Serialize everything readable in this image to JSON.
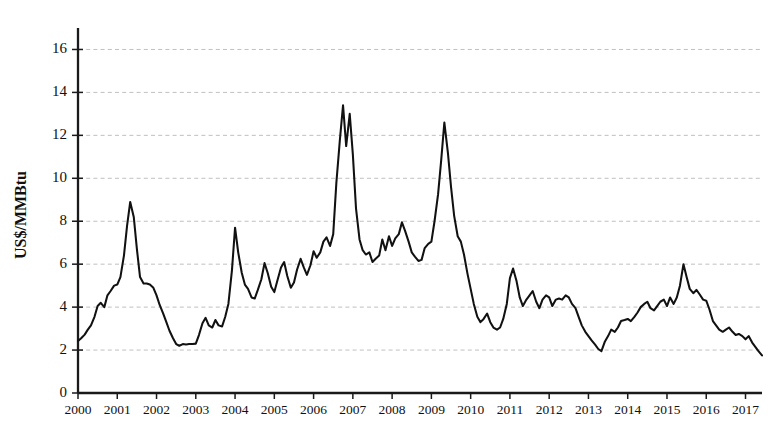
{
  "chart_data": {
    "type": "line",
    "title": "",
    "subtitle": "",
    "xlabel": "",
    "ylabel": "US$/MMBtu",
    "ylim": [
      0,
      17
    ],
    "xlim": [
      2000,
      2017.42
    ],
    "grid": true,
    "grid_axis": "y",
    "legend": false,
    "legend_position": "none",
    "annotations": [],
    "ytick_labels": [
      "0",
      "2",
      "4",
      "6",
      "8",
      "10",
      "12",
      "14",
      "16"
    ],
    "ytick_values": [
      0,
      2,
      4,
      6,
      8,
      10,
      12,
      14,
      16
    ],
    "xtick_labels": [
      "2000",
      "2001",
      "2002",
      "2003",
      "2004",
      "2005",
      "2006",
      "2007",
      "2008",
      "2009",
      "2010",
      "2011",
      "2012",
      "2013",
      "2014",
      "2015",
      "2016",
      "2017"
    ],
    "xtick_values": [
      2000,
      2001,
      2002,
      2003,
      2004,
      2005,
      2006,
      2007,
      2008,
      2009,
      2010,
      2011,
      2012,
      2013,
      2014,
      2015,
      2016,
      2017
    ],
    "series": [
      {
        "name": "Natural gas price",
        "color": "#111111",
        "x": [
          2000.0,
          2000.08,
          2000.17,
          2000.25,
          2000.33,
          2000.42,
          2000.5,
          2000.58,
          2000.67,
          2000.75,
          2000.83,
          2000.92,
          2001.0,
          2001.08,
          2001.17,
          2001.25,
          2001.33,
          2001.42,
          2001.5,
          2001.58,
          2001.67,
          2001.75,
          2001.83,
          2001.92,
          2002.0,
          2002.08,
          2002.17,
          2002.25,
          2002.33,
          2002.42,
          2002.5,
          2002.58,
          2002.67,
          2002.75,
          2002.83,
          2002.92,
          2003.0,
          2003.08,
          2003.17,
          2003.25,
          2003.33,
          2003.42,
          2003.5,
          2003.58,
          2003.67,
          2003.75,
          2003.83,
          2003.92,
          2004.0,
          2004.08,
          2004.17,
          2004.25,
          2004.33,
          2004.42,
          2004.5,
          2004.58,
          2004.67,
          2004.75,
          2004.83,
          2004.92,
          2005.0,
          2005.08,
          2005.17,
          2005.25,
          2005.33,
          2005.42,
          2005.5,
          2005.58,
          2005.67,
          2005.75,
          2005.83,
          2005.92,
          2006.0,
          2006.08,
          2006.17,
          2006.25,
          2006.33,
          2006.42,
          2006.5,
          2006.58,
          2006.67,
          2006.75,
          2006.83,
          2006.92,
          2007.0,
          2007.08,
          2007.17,
          2007.25,
          2007.33,
          2007.42,
          2007.5,
          2007.58,
          2007.67,
          2007.75,
          2007.83,
          2007.92,
          2008.0,
          2008.08,
          2008.17,
          2008.25,
          2008.33,
          2008.42,
          2008.5,
          2008.58,
          2008.67,
          2008.75,
          2008.83,
          2008.92,
          2009.0,
          2009.08,
          2009.17,
          2009.25,
          2009.33,
          2009.42,
          2009.5,
          2009.58,
          2009.67,
          2009.75,
          2009.83,
          2009.92,
          2010.0,
          2010.08,
          2010.17,
          2010.25,
          2010.33,
          2010.42,
          2010.5,
          2010.58,
          2010.67,
          2010.75,
          2010.83,
          2010.92,
          2011.0,
          2011.08,
          2011.17,
          2011.25,
          2011.33,
          2011.42,
          2011.5,
          2011.58,
          2011.67,
          2011.75,
          2011.83,
          2011.92,
          2012.0,
          2012.08,
          2012.17,
          2012.25,
          2012.33,
          2012.42,
          2012.5,
          2012.58,
          2012.67,
          2012.75,
          2012.83,
          2012.92,
          2013.0,
          2013.08,
          2013.17,
          2013.25,
          2013.33,
          2013.42,
          2013.5,
          2013.58,
          2013.67,
          2013.75,
          2013.83,
          2013.92,
          2014.0,
          2014.08,
          2014.17,
          2014.25,
          2014.33,
          2014.42,
          2014.5,
          2014.58,
          2014.67,
          2014.75,
          2014.83,
          2014.92,
          2015.0,
          2015.08,
          2015.17,
          2015.25,
          2015.33,
          2015.42,
          2015.5,
          2015.58,
          2015.67,
          2015.75,
          2015.83,
          2015.92,
          2016.0,
          2016.08,
          2016.17,
          2016.25,
          2016.33,
          2016.42,
          2016.5,
          2016.58,
          2016.67,
          2016.75,
          2016.83,
          2016.92,
          2017.0,
          2017.08,
          2017.17,
          2017.25,
          2017.33,
          2017.42
        ],
        "values": [
          2.42,
          2.55,
          2.72,
          2.95,
          3.15,
          3.55,
          4.05,
          4.2,
          4.0,
          4.55,
          4.75,
          5.0,
          5.05,
          5.4,
          6.4,
          7.8,
          8.9,
          8.2,
          6.7,
          5.4,
          5.1,
          5.1,
          5.05,
          4.9,
          4.55,
          4.1,
          3.7,
          3.3,
          2.9,
          2.55,
          2.28,
          2.2,
          2.28,
          2.26,
          2.28,
          2.28,
          2.3,
          2.7,
          3.25,
          3.5,
          3.15,
          3.05,
          3.4,
          3.15,
          3.1,
          3.55,
          4.15,
          5.7,
          7.7,
          6.55,
          5.6,
          5.05,
          4.85,
          4.45,
          4.4,
          4.8,
          5.3,
          6.05,
          5.6,
          4.95,
          4.7,
          5.25,
          5.85,
          6.1,
          5.45,
          4.9,
          5.15,
          5.75,
          6.25,
          5.85,
          5.5,
          5.95,
          6.6,
          6.3,
          6.55,
          7.05,
          7.25,
          6.85,
          7.4,
          9.8,
          11.8,
          13.4,
          11.5,
          13.0,
          11.1,
          8.6,
          7.15,
          6.65,
          6.45,
          6.55,
          6.1,
          6.25,
          6.4,
          7.15,
          6.65,
          7.3,
          6.85,
          7.2,
          7.4,
          7.95,
          7.55,
          7.05,
          6.55,
          6.35,
          6.15,
          6.2,
          6.75,
          6.95,
          7.05,
          8.0,
          9.25,
          10.85,
          12.6,
          11.2,
          9.6,
          8.25,
          7.3,
          7.05,
          6.45,
          5.55,
          4.85,
          4.15,
          3.55,
          3.3,
          3.45,
          3.7,
          3.3,
          3.05,
          2.95,
          3.05,
          3.45,
          4.15,
          5.35,
          5.8,
          5.2,
          4.45,
          4.05,
          4.35,
          4.55,
          4.75,
          4.25,
          3.95,
          4.35,
          4.55,
          4.45,
          4.05,
          4.35,
          4.4,
          4.35,
          4.55,
          4.45,
          4.15,
          3.95,
          3.55,
          3.15,
          2.85,
          2.65,
          2.45,
          2.25,
          2.05,
          1.95,
          2.4,
          2.65,
          2.95,
          2.85,
          3.05,
          3.35,
          3.4,
          3.45,
          3.35,
          3.55,
          3.75,
          4.0,
          4.15,
          4.25,
          3.95,
          3.85,
          4.05,
          4.25,
          4.35,
          4.05,
          4.45,
          4.15,
          4.45,
          5.0,
          6.0,
          5.4,
          4.85,
          4.65,
          4.8,
          4.6,
          4.35,
          4.3,
          3.9,
          3.35,
          3.15,
          2.95,
          2.85,
          2.95,
          3.05,
          2.85,
          2.7,
          2.75,
          2.65,
          2.5,
          2.65,
          2.35,
          2.15,
          1.95,
          1.75
        ]
      }
    ]
  }
}
